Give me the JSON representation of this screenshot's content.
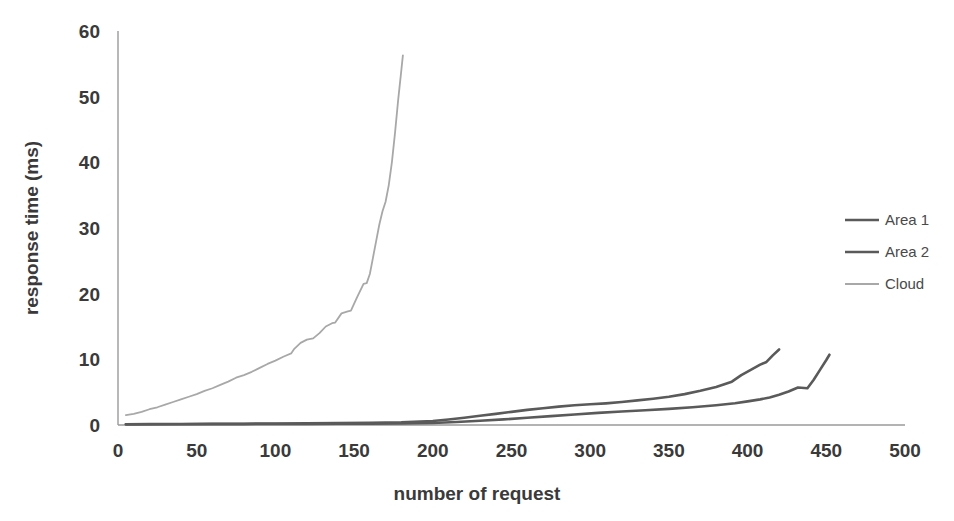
{
  "chart_data": {
    "type": "line",
    "title": "",
    "xlabel": "number of request",
    "ylabel": "response time (ms)",
    "xlim": [
      0,
      500
    ],
    "ylim": [
      0,
      60
    ],
    "xticks": [
      0,
      50,
      100,
      150,
      200,
      250,
      300,
      350,
      400,
      450,
      500
    ],
    "yticks": [
      0,
      10,
      20,
      30,
      40,
      50,
      60
    ],
    "grid": false,
    "legend_position": "right",
    "series": [
      {
        "name": "Area 1",
        "color": "#5a5a5a",
        "x": [
          5,
          20,
          40,
          60,
          80,
          100,
          120,
          140,
          160,
          180,
          200,
          210,
          220,
          230,
          240,
          250,
          260,
          270,
          280,
          290,
          300,
          310,
          320,
          330,
          340,
          350,
          360,
          370,
          380,
          390,
          396,
          402,
          408,
          412,
          416,
          420
        ],
        "y": [
          0.12,
          0.14,
          0.16,
          0.18,
          0.2,
          0.22,
          0.25,
          0.28,
          0.32,
          0.4,
          0.6,
          0.85,
          1.1,
          1.4,
          1.7,
          2.0,
          2.3,
          2.55,
          2.8,
          3.0,
          3.15,
          3.3,
          3.5,
          3.75,
          4.0,
          4.3,
          4.7,
          5.2,
          5.8,
          6.6,
          7.6,
          8.4,
          9.2,
          9.6,
          10.6,
          11.5
        ]
      },
      {
        "name": "Area 2",
        "color": "#5a5a5a",
        "x": [
          5,
          20,
          40,
          60,
          80,
          100,
          120,
          140,
          160,
          180,
          200,
          215,
          230,
          245,
          260,
          275,
          290,
          305,
          320,
          335,
          350,
          365,
          380,
          392,
          400,
          408,
          414,
          420,
          426,
          432,
          438,
          442,
          446,
          450,
          452
        ],
        "y": [
          0.1,
          0.11,
          0.12,
          0.13,
          0.14,
          0.15,
          0.16,
          0.18,
          0.2,
          0.24,
          0.3,
          0.45,
          0.65,
          0.85,
          1.1,
          1.35,
          1.6,
          1.85,
          2.05,
          2.25,
          2.45,
          2.7,
          3.0,
          3.3,
          3.6,
          3.9,
          4.2,
          4.6,
          5.1,
          5.7,
          5.6,
          6.9,
          8.4,
          9.9,
          10.7
        ]
      },
      {
        "name": "Cloud",
        "color": "#a8a8a8",
        "x": [
          5,
          10,
          15,
          20,
          25,
          30,
          35,
          40,
          45,
          50,
          55,
          60,
          65,
          70,
          75,
          80,
          85,
          90,
          95,
          100,
          105,
          110,
          112,
          116,
          120,
          124,
          128,
          132,
          136,
          138,
          142,
          146,
          148,
          152,
          156,
          158,
          160,
          162,
          164,
          166,
          168,
          170,
          172,
          174,
          176,
          178,
          180,
          181
        ],
        "y": [
          1.5,
          1.7,
          2.0,
          2.4,
          2.7,
          3.1,
          3.5,
          3.9,
          4.3,
          4.7,
          5.2,
          5.6,
          6.1,
          6.6,
          7.2,
          7.6,
          8.1,
          8.7,
          9.3,
          9.8,
          10.4,
          10.9,
          11.6,
          12.5,
          13.0,
          13.2,
          14.0,
          15.0,
          15.5,
          15.6,
          17.0,
          17.3,
          17.4,
          19.5,
          21.5,
          21.6,
          23.0,
          25.5,
          28.0,
          30.5,
          32.5,
          34.0,
          36.5,
          40.0,
          44.5,
          49.5,
          54.0,
          56.3
        ]
      }
    ]
  },
  "axes": {
    "x_tick_labels": [
      "0",
      "50",
      "100",
      "150",
      "200",
      "250",
      "300",
      "350",
      "400",
      "450",
      "500"
    ],
    "y_tick_labels": [
      "0",
      "10",
      "20",
      "30",
      "40",
      "50",
      "60"
    ],
    "x_axis_title": "number of request",
    "y_axis_title": "response time (ms)"
  },
  "legend": {
    "items": [
      {
        "label": "Area 1",
        "color": "#5a5a5a"
      },
      {
        "label": "Area 2",
        "color": "#5a5a5a"
      },
      {
        "label": "Cloud",
        "color": "#a8a8a8"
      }
    ]
  }
}
